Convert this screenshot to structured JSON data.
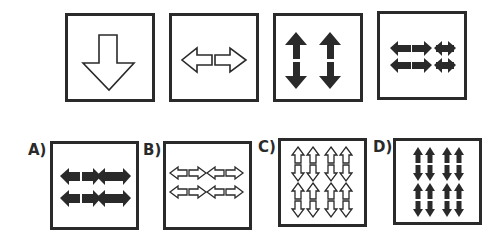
{
  "puzzle": {
    "sequence": [
      {
        "id": "seq-1",
        "description": "single large outlined down arrow"
      },
      {
        "id": "seq-2",
        "description": "two outlined horizontal arrows pointing left and right"
      },
      {
        "id": "seq-3",
        "description": "two black vertical double-headed arrows"
      },
      {
        "id": "seq-4",
        "description": "four black horizontal double-headed arrows in 2x2 grid"
      }
    ],
    "options": [
      {
        "label": "A)",
        "description": "four black horizontal double-headed arrows in 2x2 grid"
      },
      {
        "label": "B)",
        "description": "four outlined horizontal double-headed arrows in 2x2 grid"
      },
      {
        "label": "C)",
        "description": "eight outlined vertical double-headed arrows in 4x2 grid"
      },
      {
        "label": "D)",
        "description": "eight black vertical double-headed arrows in 4x2 grid"
      }
    ]
  },
  "colors": {
    "stroke": "#2a2a2a",
    "fill": "#2a2a2a",
    "background": "#ffffff"
  }
}
